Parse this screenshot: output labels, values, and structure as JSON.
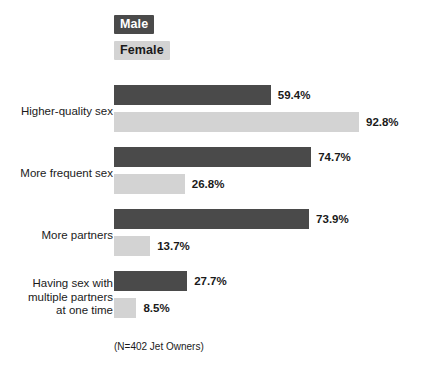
{
  "legend": {
    "male_label": "Male",
    "female_label": "Female",
    "male_color": "#4a4a4a",
    "female_color": "#d3d3d3"
  },
  "footnote": "(N=402 Jet Owners)",
  "chart_data": {
    "type": "bar",
    "orientation": "horizontal",
    "title": "",
    "xlabel": "",
    "ylabel": "",
    "xlim": [
      0,
      100
    ],
    "grid": false,
    "legend_position": "top-left",
    "value_suffix": "%",
    "note": "(N=402 Jet Owners)",
    "categories": [
      "Higher-quality sex",
      "More frequent sex",
      "More partners",
      "Having sex with multiple partners at one time"
    ],
    "category_lines": [
      [
        "Higher-quality sex"
      ],
      [
        "More frequent sex"
      ],
      [
        "More partners"
      ],
      [
        "Having sex with",
        "multiple partners",
        "at one time"
      ]
    ],
    "series": [
      {
        "name": "Male",
        "color": "#4a4a4a",
        "values": [
          59.4,
          74.7,
          73.9,
          27.7
        ]
      },
      {
        "name": "Female",
        "color": "#d3d3d3",
        "values": [
          92.8,
          26.8,
          13.7,
          8.5
        ]
      }
    ],
    "value_labels": {
      "male": [
        "59.4%",
        "74.7%",
        "73.9%",
        "27.7%"
      ],
      "female": [
        "92.8%",
        "26.8%",
        "13.7%",
        "8.5%"
      ]
    }
  }
}
